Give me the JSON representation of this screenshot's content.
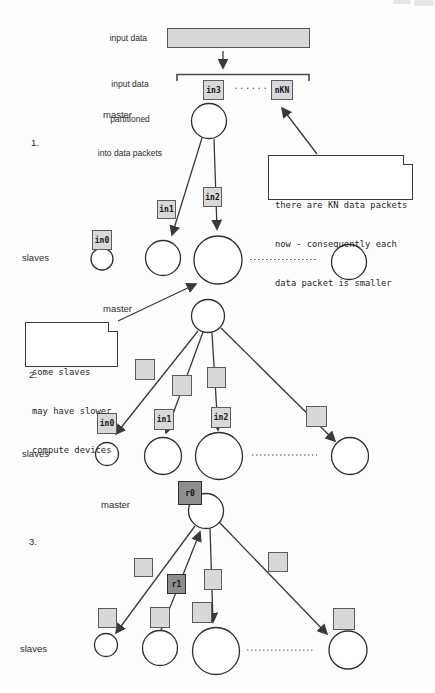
{
  "colors": {
    "packet_fill": "#d8d8d8",
    "packet_border": "#5c5c5c",
    "result_fill": "#8d8d8d",
    "line": "#3a3a3a",
    "node_fill": "#ffffff"
  },
  "header": {
    "input_label": "input data",
    "partition_lines": [
      "input data",
      "partitioned",
      "into data packets"
    ],
    "packets": {
      "in3": "in3",
      "dots": "......",
      "nKN": "nKN"
    }
  },
  "notes": {
    "kn": {
      "lines": [
        "there are KN data packets",
        "now - consequently each",
        "data packet is smaller"
      ]
    },
    "slow": {
      "lines": [
        "some slaves",
        "may have slower",
        "compute devices"
      ]
    }
  },
  "sections": {
    "s1": {
      "number": "1.",
      "master": "master",
      "slaves": "slaves",
      "packets": {
        "in0": "in0",
        "in1": "in1",
        "in2": "in2"
      }
    },
    "s2": {
      "number": "2.",
      "master": "master",
      "slaves": "slaves",
      "packets": {
        "in0": "in0",
        "in1": "in1",
        "in2": "in2"
      }
    },
    "s3": {
      "number": "3.",
      "master": "master",
      "slaves": "slaves",
      "results": {
        "r0": "r0",
        "r1": "r1"
      }
    }
  }
}
